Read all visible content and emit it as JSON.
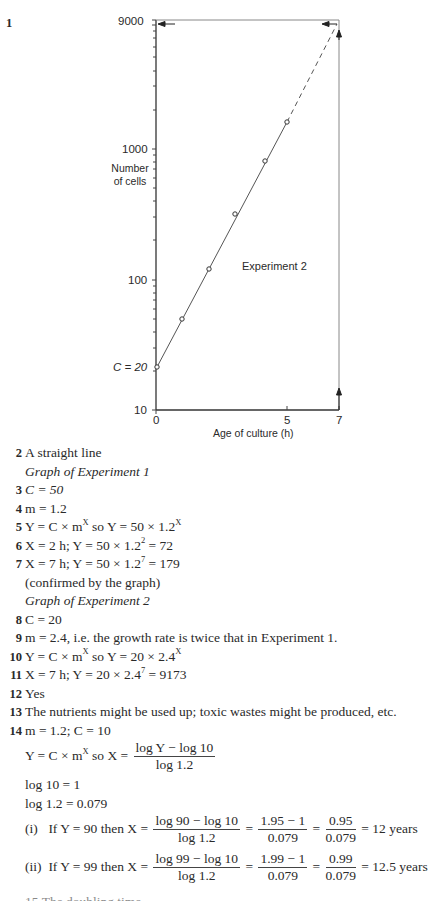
{
  "question_1_number": "1",
  "chart_data": {
    "type": "scatter",
    "title": "Experiment 2",
    "xlabel": "Age of culture (h)",
    "ylabel": "Number of cells",
    "yscale": "log",
    "xlim": [
      0,
      7
    ],
    "ylim": [
      10,
      9000
    ],
    "x_ticks": [
      "0",
      "5",
      "7"
    ],
    "y_ticks": [
      "10",
      "100",
      "1000",
      "9000"
    ],
    "y_intercept_label": "C = 20",
    "grid": false,
    "legend": "none",
    "series": [
      {
        "name": "Experiment 2 (measured)",
        "style": "points with solid fitted line",
        "x": [
          0,
          1,
          2,
          3,
          4,
          4.7
        ],
        "y": [
          20,
          48,
          115,
          276,
          663,
          1560
        ]
      },
      {
        "name": "Extrapolation",
        "style": "dashed line",
        "x": [
          4.7,
          7
        ],
        "y": [
          1560,
          9000
        ]
      }
    ],
    "annotations": [
      "Vertical arrow up from x = 7 to the line",
      "Horizontal arrow from the line at x = 7 back to y-axis value 9000"
    ]
  },
  "answers": [
    {
      "num": "2",
      "text": "A straight line"
    },
    {
      "num": "",
      "text": "Graph of Experiment 1",
      "italic": true
    },
    {
      "num": "3",
      "text": "C = 50"
    },
    {
      "num": "4",
      "text": "m = 1.2"
    },
    {
      "num": "5",
      "text": "Y = C × m^X so Y = 50 × 1.2^X"
    },
    {
      "num": "6",
      "text": "X = 2 h; Y = 50 × 1.2^2 = 72"
    },
    {
      "num": "7",
      "text": "X = 7 h; Y = 50 × 1.2^7 = 179"
    },
    {
      "num": "",
      "text": "(confirmed by the graph)"
    },
    {
      "num": "",
      "text": "Graph of Experiment 2",
      "italic": true
    },
    {
      "num": "8",
      "text": "C = 20"
    },
    {
      "num": "9",
      "text": "m = 2.4, i.e. the growth rate is twice that in Experiment 1."
    },
    {
      "num": "10",
      "text": "Y = C × m^X so Y = 20 × 2.4^X"
    },
    {
      "num": "11",
      "text": "X = 7 h; Y = 20 × 2.4^7 = 9173"
    },
    {
      "num": "12",
      "text": "Yes"
    },
    {
      "num": "13",
      "text": "The nutrients might be used up; toxic wastes might be produced, etc."
    },
    {
      "num": "14",
      "text": "m = 1.2; C = 10"
    }
  ],
  "q14": {
    "formula_lhs": "Y = C × m^X so X =",
    "formula_num": "log Y − log 10",
    "formula_den": "log 1.2",
    "log10": "log 10 = 1",
    "log12": "log 1.2 = 0.079",
    "part_i": {
      "label": "(i)",
      "lhs": "If Y = 90 then X =",
      "f1_num": "log 90 − log 10",
      "f1_den": "log 1.2",
      "f2_num": "1.95 − 1",
      "f2_den": "0.079",
      "f3_num": "0.95",
      "f3_den": "0.079",
      "result": "= 12 years"
    },
    "part_ii": {
      "label": "(ii)",
      "lhs": "If Y = 99 then X =",
      "f1_num": "log 99 − log 10",
      "f1_den": "log 1.2",
      "f2_num": "1.99 − 1",
      "f2_den": "0.079",
      "f3_num": "0.99",
      "f3_den": "0.079",
      "result": "= 12.5 years"
    },
    "cut_off_line": "15  The doubling time..."
  }
}
